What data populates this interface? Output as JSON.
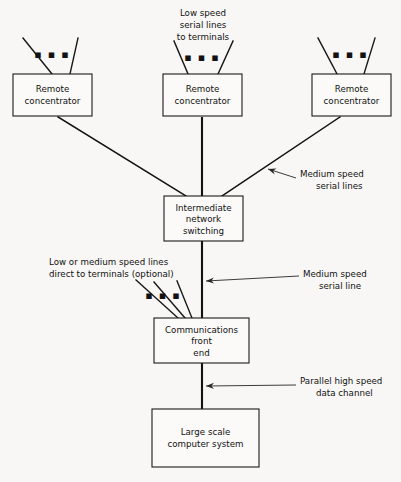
{
  "diagram": {
    "background_color": "#f8f7f5",
    "line_color": "#121212",
    "box_fill": "#fbfaf8",
    "ellipsis": "▪ ▪ ▪",
    "nodes": {
      "remote_concentrator_left": {
        "line1": "Remote",
        "line2": "concentrator",
        "x": 13,
        "y": 74,
        "w": 79,
        "h": 42
      },
      "remote_concentrator_center": {
        "line1": "Remote",
        "line2": "concentrator",
        "x": 163,
        "y": 74,
        "w": 79,
        "h": 42
      },
      "remote_concentrator_right": {
        "line1": "Remote",
        "line2": "concentrator",
        "x": 312,
        "y": 74,
        "w": 79,
        "h": 42
      },
      "intermediate_network_switching": {
        "line1": "Intermediate",
        "line2": "network",
        "line3": "switching",
        "x": 164,
        "y": 196,
        "w": 79,
        "h": 45
      },
      "communications_front_end": {
        "line1": "Communications",
        "line2": "front",
        "line3": "end",
        "x": 154,
        "y": 318,
        "w": 95,
        "h": 45
      },
      "large_scale_computer_system": {
        "line1": "Large scale",
        "line2": "computer system",
        "x": 152,
        "y": 409,
        "w": 107,
        "h": 58
      }
    },
    "annotations": {
      "low_speed_serial_lines": {
        "line1": "Low speed",
        "line2": "serial lines",
        "line3": "to terminals"
      },
      "medium_speed_serial_lines": {
        "line1": "Medium speed",
        "line2": "serial lines"
      },
      "low_or_medium_optional": {
        "line1": "Low or medium speed lines",
        "line2": "direct to terminals (optional)"
      },
      "medium_speed_serial_line": {
        "line1": "Medium speed",
        "line2": "serial line"
      },
      "parallel_high_speed_channel": {
        "line1": "Parallel high speed",
        "line2": "data channel"
      }
    }
  }
}
